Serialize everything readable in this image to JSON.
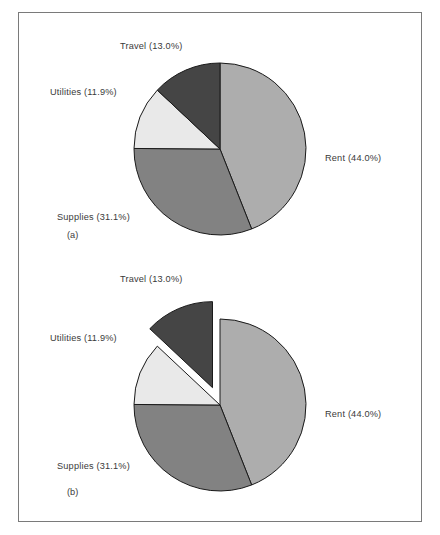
{
  "figure": {
    "background_color": "#ffffff",
    "border_color": "#7a7a7a",
    "text_color": "#3a3a3a"
  },
  "panels": [
    {
      "caption": "(a)",
      "caption_x": 48,
      "caption_y": 212,
      "exploded": false,
      "center_x": 201,
      "center_y": 136,
      "radius": 86
    },
    {
      "caption": "(b)",
      "caption_x": 48,
      "caption_y": 228,
      "exploded": true,
      "center_x": 201,
      "center_y": 149,
      "radius": 86
    }
  ],
  "labels": {
    "rent": "Rent (44.0%)",
    "supplies": "Supplies (31.1%)",
    "utilities": "Utilities (11.9%)",
    "travel": "Travel (13.0%)"
  },
  "chart_data": {
    "type": "pie",
    "title": "",
    "subtitle": "",
    "xlabel": "",
    "ylabel": "",
    "legend_position": "outside-labels",
    "grid": false,
    "start_angle_deg": 90,
    "direction": "clockwise",
    "categories": [
      "Rent",
      "Supplies",
      "Utilities",
      "Travel"
    ],
    "values": [
      44.0,
      31.1,
      11.9,
      13.0
    ],
    "value_unit": "percent",
    "data_labels": [
      "Rent (44.0%)",
      "Supplies (31.1%)",
      "Utilities (11.9%)",
      "Travel (13.0%)"
    ],
    "colors": [
      "#adadad",
      "#828282",
      "#e9e9e9",
      "#454545"
    ],
    "slice_edge_color": "#1a1a1a",
    "panels": [
      {
        "label": "(a)",
        "exploded_slices": [],
        "explode_offsets": [
          0,
          0,
          0,
          0
        ]
      },
      {
        "label": "(b)",
        "exploded_slices": [
          "Travel"
        ],
        "explode_offsets": [
          0,
          0,
          0,
          0.22
        ]
      }
    ],
    "annotations": [
      "(a)",
      "(b)"
    ]
  }
}
